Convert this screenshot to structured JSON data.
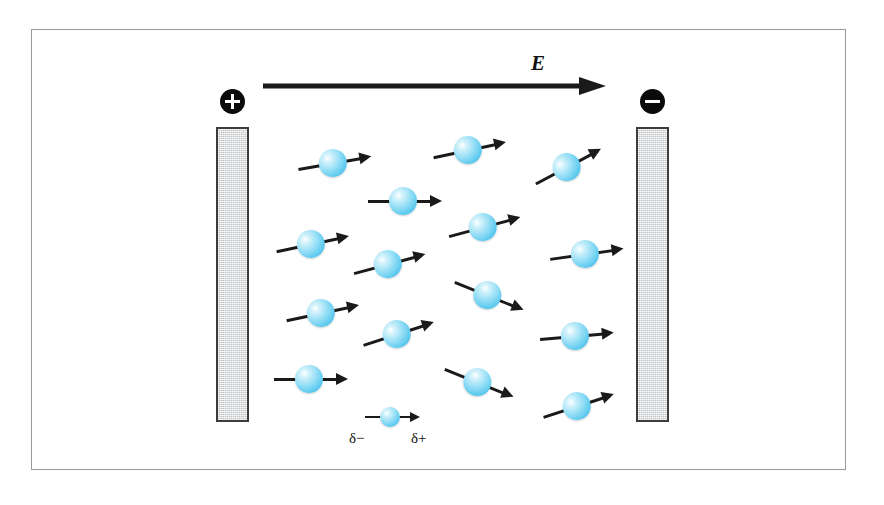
{
  "figure": {
    "background_color": "#ffffff",
    "frame_color": "#9a9a9a"
  },
  "field": {
    "label": "E",
    "arrow_direction": "right",
    "arrow_color": "#1a1a1a",
    "description": "uniform electric field pointing from the positive plate to the negative plate"
  },
  "plates": [
    {
      "name": "positive-plate",
      "sign_label": "+",
      "polarity": "positive",
      "fill_color": "#dcdee0",
      "border_color": "#3c3c3c",
      "side": "left"
    },
    {
      "name": "negative-plate",
      "sign_label": "−",
      "polarity": "negative",
      "fill_color": "#dcdee0",
      "border_color": "#3c3c3c",
      "side": "right"
    }
  ],
  "legend": {
    "negative_end_label": "δ−",
    "positive_end_label": "δ+",
    "description": "A single polar molecule: partial negative charge at the tail, partial positive charge at the arrow head"
  },
  "molecule_style": {
    "sphere_color": "#66cdf0",
    "sphere_highlight": "#ffffff",
    "sphere_edge": "#29a9d6",
    "dipole_color": "#1a1a1a"
  },
  "molecules": [
    {
      "id": 1,
      "x": 333,
      "y": 164,
      "angle": -10
    },
    {
      "id": 2,
      "x": 468,
      "y": 151,
      "angle": -12
    },
    {
      "id": 3,
      "x": 567,
      "y": 168,
      "angle": -28
    },
    {
      "id": 4,
      "x": 403,
      "y": 202,
      "angle": 0
    },
    {
      "id": 5,
      "x": 311,
      "y": 245,
      "angle": -12
    },
    {
      "id": 6,
      "x": 483,
      "y": 228,
      "angle": -15
    },
    {
      "id": 7,
      "x": 585,
      "y": 255,
      "angle": -8
    },
    {
      "id": 8,
      "x": 388,
      "y": 265,
      "angle": -15
    },
    {
      "id": 9,
      "x": 487,
      "y": 296,
      "angle": 22
    },
    {
      "id": 10,
      "x": 321,
      "y": 314,
      "angle": -12
    },
    {
      "id": 11,
      "x": 397,
      "y": 335,
      "angle": -18
    },
    {
      "id": 12,
      "x": 575,
      "y": 337,
      "angle": -5
    },
    {
      "id": 13,
      "x": 309,
      "y": 380,
      "angle": 0
    },
    {
      "id": 14,
      "x": 477,
      "y": 383,
      "angle": 22
    },
    {
      "id": 15,
      "x": 577,
      "y": 407,
      "angle": -18
    }
  ]
}
